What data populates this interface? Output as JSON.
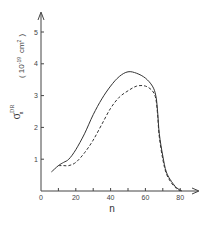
{
  "chart_data": {
    "type": "line",
    "title": "",
    "xlabel": "n",
    "ylabel": "σ_n^DR",
    "ylabel_units": "( 10^-19 cm^2 )",
    "xlim": [
      0,
      85
    ],
    "ylim": [
      0,
      5.5
    ],
    "x_ticks": [
      0,
      10,
      20,
      30,
      40,
      50,
      60,
      70,
      80
    ],
    "x_tick_labels": [
      "0",
      "20",
      "40",
      "60",
      "80"
    ],
    "y_ticks": [
      1,
      2,
      3,
      4,
      5
    ],
    "y_tick_labels": [
      "1",
      "2",
      "3",
      "4",
      "5"
    ],
    "grid": false,
    "legend": null,
    "series": [
      {
        "name": "solid",
        "style": "solid",
        "x": [
          6,
          10,
          13,
          16,
          20,
          25,
          30,
          35,
          40,
          45,
          50,
          55,
          60,
          64,
          66,
          67,
          68,
          70,
          72,
          75,
          78,
          81
        ],
        "values": [
          0.6,
          0.8,
          0.9,
          1.0,
          1.3,
          1.8,
          2.4,
          2.9,
          3.3,
          3.6,
          3.75,
          3.7,
          3.55,
          3.3,
          3.0,
          2.5,
          1.8,
          1.1,
          0.6,
          0.3,
          0.1,
          0.0
        ]
      },
      {
        "name": "dashed",
        "style": "dashed",
        "x": [
          10,
          13,
          16,
          20,
          25,
          30,
          35,
          40,
          45,
          50,
          55,
          60,
          64,
          66,
          67,
          68,
          70,
          72,
          75,
          78,
          80
        ],
        "values": [
          0.8,
          0.8,
          0.8,
          0.9,
          1.2,
          1.6,
          2.1,
          2.6,
          2.95,
          3.15,
          3.3,
          3.3,
          3.15,
          2.9,
          2.4,
          1.7,
          1.0,
          0.55,
          0.25,
          0.07,
          0.0
        ]
      }
    ]
  },
  "axes": {
    "x_label": "n",
    "y_symbol": "σ",
    "y_sup": "DR",
    "y_sub": "n",
    "y_units": "( 10",
    "y_units_exp": "-19",
    "y_units_tail": "cm",
    "y_units_tail_exp": "2",
    "y_units_close": ")"
  }
}
